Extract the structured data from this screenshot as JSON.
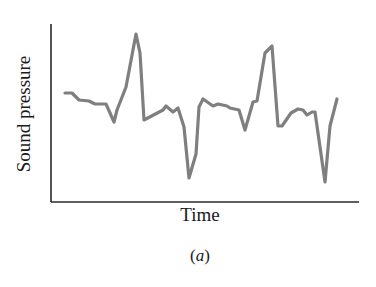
{
  "chart_data": {
    "type": "line",
    "title": "",
    "xlabel": "Time",
    "ylabel": "Sound pressure",
    "caption_letter": "a",
    "grid": false,
    "legend": null,
    "ticks": {
      "x": [],
      "y": []
    },
    "axis_color": "#2a2a2a",
    "line_color": "#7f7f7f",
    "points_px": [
      [
        65,
        93
      ],
      [
        72,
        93
      ],
      [
        79,
        100
      ],
      [
        89,
        101
      ],
      [
        95,
        104
      ],
      [
        106,
        104
      ],
      [
        114,
        122
      ],
      [
        117,
        110
      ],
      [
        126,
        87
      ],
      [
        136,
        34
      ],
      [
        140,
        53
      ],
      [
        144,
        120
      ],
      [
        163,
        110
      ],
      [
        166,
        106
      ],
      [
        173,
        112
      ],
      [
        178,
        108
      ],
      [
        184,
        127
      ],
      [
        189,
        178
      ],
      [
        196,
        154
      ],
      [
        199,
        107
      ],
      [
        203,
        99
      ],
      [
        213,
        106
      ],
      [
        218,
        104
      ],
      [
        227,
        106
      ],
      [
        230,
        108
      ],
      [
        239,
        110
      ],
      [
        245,
        130
      ],
      [
        253,
        102
      ],
      [
        257,
        101
      ],
      [
        265,
        53
      ],
      [
        272,
        46
      ],
      [
        278,
        126
      ],
      [
        282,
        126
      ],
      [
        291,
        113
      ],
      [
        298,
        109
      ],
      [
        303,
        110
      ],
      [
        307,
        115
      ],
      [
        312,
        112
      ],
      [
        315,
        112
      ],
      [
        325,
        182
      ],
      [
        330,
        126
      ],
      [
        337,
        99
      ]
    ],
    "axes_px": {
      "x0": 51,
      "y_top": 24,
      "y_axis_bottom": 202,
      "x_end": 359
    }
  },
  "labels": {
    "xlabel": "Time",
    "ylabel": "Sound pressure",
    "caption_open": "(",
    "caption_letter": "a",
    "caption_close": ")"
  }
}
